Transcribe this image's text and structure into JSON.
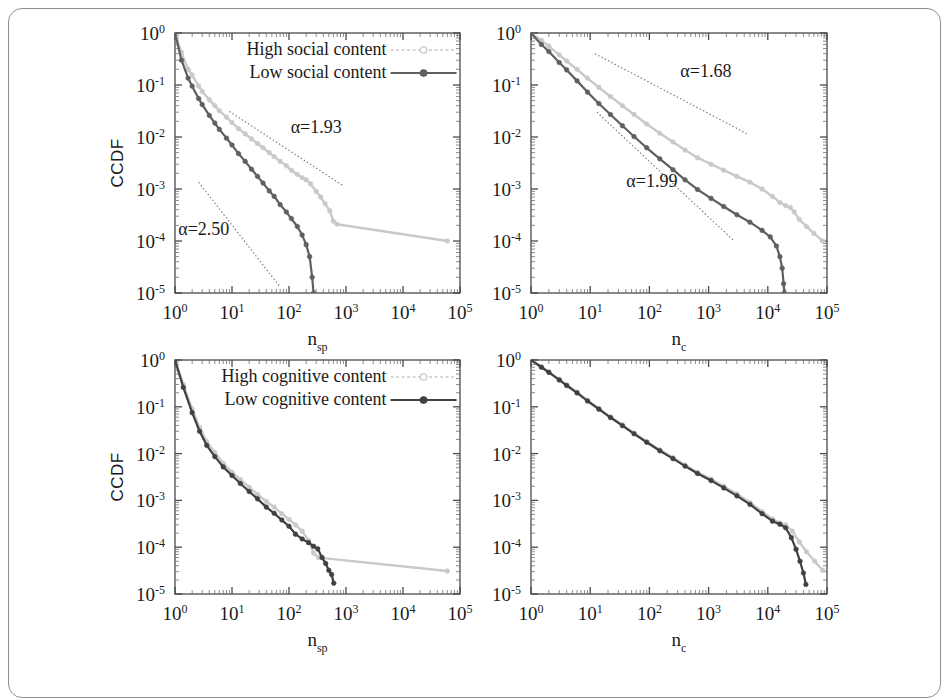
{
  "figure": {
    "frame_border_color": "#8d9096",
    "background": "#ffffff",
    "series_colors": {
      "high": "#c9c9c9",
      "low": "#5f5f5f",
      "low_dark": "#404040",
      "fit_line": "#777777"
    }
  },
  "chart_data": [
    {
      "id": "panel-top-left",
      "type": "line",
      "title": "",
      "xlabel": "n_sp",
      "xlabel_base": "n",
      "xlabel_sub": "sp",
      "ylabel": "CCDF",
      "xscale": "log",
      "yscale": "log",
      "xlim": [
        1,
        100000
      ],
      "ylim": [
        1e-05,
        1
      ],
      "xticks": [
        "10^0",
        "10^1",
        "10^2",
        "10^3",
        "10^4",
        "10^5"
      ],
      "yticks": [
        "10^0",
        "10^-1",
        "10^-2",
        "10^-3",
        "10^-4",
        "10^-5"
      ],
      "grid": false,
      "legend_position": "top-center",
      "legend": [
        {
          "label": "High social content",
          "color": "#c9c9c9",
          "marker": "circle-open"
        },
        {
          "label": "Low social content",
          "color": "#5f5f5f",
          "marker": "circle-filled"
        }
      ],
      "annotations": [
        {
          "text": "α=1.93",
          "x": 300,
          "y": 0.012
        },
        {
          "text": "α=2.50",
          "x": 3.2,
          "y": 0.00013
        }
      ],
      "fit_lines": [
        {
          "alpha": 1.93,
          "x0": 9,
          "y0": 0.031,
          "x1": 900,
          "y1": 0.00115
        },
        {
          "alpha": 2.5,
          "x0": 2.6,
          "y0": 0.00135,
          "x1": 70,
          "y1": 1.3e-05
        }
      ],
      "series": [
        {
          "name": "High social content",
          "color": "#c9c9c9",
          "x": [
            1,
            1.3,
            1.7,
            2,
            2.6,
            3,
            4,
            5,
            6,
            8,
            10,
            13,
            17,
            22,
            28,
            35,
            45,
            55,
            70,
            90,
            110,
            140,
            170,
            200,
            240,
            300,
            360,
            430,
            520,
            600,
            700,
            60000
          ],
          "y": [
            1.0,
            0.42,
            0.2,
            0.155,
            0.095,
            0.075,
            0.052,
            0.04,
            0.032,
            0.024,
            0.019,
            0.0145,
            0.0115,
            0.0092,
            0.0075,
            0.0062,
            0.005,
            0.0042,
            0.0034,
            0.0028,
            0.0023,
            0.0019,
            0.00165,
            0.0015,
            0.00125,
            0.0009,
            0.0007,
            0.00052,
            0.00038,
            0.00024,
            0.00021,
            0.0001
          ]
        },
        {
          "name": "Low social content",
          "color": "#5f5f5f",
          "x": [
            1,
            1.3,
            1.7,
            2,
            2.6,
            3,
            4,
            5,
            6,
            8,
            10,
            13,
            17,
            22,
            28,
            35,
            45,
            55,
            70,
            90,
            110,
            140,
            170,
            200,
            230,
            255,
            270
          ],
          "y": [
            1.0,
            0.3,
            0.135,
            0.095,
            0.055,
            0.042,
            0.026,
            0.0185,
            0.014,
            0.0095,
            0.007,
            0.0048,
            0.0034,
            0.0024,
            0.00175,
            0.0013,
            0.00092,
            0.00072,
            0.0005,
            0.00036,
            0.00027,
            0.00019,
            0.00013,
            8.5e-05,
            5e-05,
            2e-05,
            1e-05
          ]
        }
      ]
    },
    {
      "id": "panel-top-right",
      "type": "line",
      "title": "",
      "xlabel": "n_c",
      "xlabel_base": "n",
      "xlabel_sub": "c",
      "ylabel": "",
      "xscale": "log",
      "yscale": "log",
      "xlim": [
        1,
        100000
      ],
      "ylim": [
        1e-05,
        1
      ],
      "xticks": [
        "10^0",
        "10^1",
        "10^2",
        "10^3",
        "10^4",
        "10^5"
      ],
      "yticks": [
        "10^0",
        "10^-1",
        "10^-2",
        "10^-3",
        "10^-4",
        "10^-5"
      ],
      "grid": false,
      "legend_position": "none",
      "legend": [],
      "annotations": [
        {
          "text": "α=1.68",
          "x": 900,
          "y": 0.14
        },
        {
          "text": "α=1.99",
          "x": 110,
          "y": 0.0011
        }
      ],
      "fit_lines": [
        {
          "alpha": 1.68,
          "x0": 12,
          "y0": 0.4,
          "x1": 4500,
          "y1": 0.0115
        },
        {
          "alpha": 1.99,
          "x0": 13,
          "y0": 0.03,
          "x1": 2700,
          "y1": 0.0001
        }
      ],
      "series": [
        {
          "name": "High cumulative",
          "color": "#c9c9c9",
          "x": [
            1,
            1.5,
            2,
            3,
            4,
            6,
            9,
            14,
            22,
            35,
            55,
            90,
            150,
            250,
            400,
            650,
            1100,
            1800,
            3000,
            5000,
            8000,
            12000,
            16000,
            20000,
            24000,
            28000,
            34000,
            45000,
            60000,
            85000
          ],
          "y": [
            1.0,
            0.72,
            0.56,
            0.38,
            0.29,
            0.2,
            0.135,
            0.09,
            0.06,
            0.04,
            0.027,
            0.0178,
            0.0118,
            0.008,
            0.0056,
            0.004,
            0.003,
            0.0023,
            0.00175,
            0.00135,
            0.001,
            0.00072,
            0.00055,
            0.00048,
            0.00044,
            0.00036,
            0.00026,
            0.00019,
            0.00014,
            0.0001
          ]
        },
        {
          "name": "Low cumulative",
          "color": "#5f5f5f",
          "x": [
            1,
            1.5,
            2,
            3,
            4,
            6,
            9,
            14,
            22,
            35,
            55,
            90,
            150,
            250,
            400,
            650,
            1100,
            1800,
            3000,
            5000,
            8000,
            11000,
            14000,
            16000,
            17500,
            18500,
            19000
          ],
          "y": [
            1.0,
            0.6,
            0.44,
            0.27,
            0.195,
            0.12,
            0.073,
            0.044,
            0.027,
            0.0165,
            0.0102,
            0.0062,
            0.0038,
            0.00235,
            0.0015,
            0.00098,
            0.00066,
            0.00046,
            0.00032,
            0.00023,
            0.00016,
            0.00012,
            8e-05,
            5e-05,
            3e-05,
            1.5e-05,
            1e-05
          ]
        }
      ]
    },
    {
      "id": "panel-bottom-left",
      "type": "line",
      "title": "",
      "xlabel": "n_sp",
      "xlabel_base": "n",
      "xlabel_sub": "sp",
      "ylabel": "CCDF",
      "xscale": "log",
      "yscale": "log",
      "xlim": [
        1,
        100000
      ],
      "ylim": [
        1e-05,
        1
      ],
      "xticks": [
        "10^0",
        "10^1",
        "10^2",
        "10^3",
        "10^4",
        "10^5"
      ],
      "yticks": [
        "10^0",
        "10^-1",
        "10^-2",
        "10^-3",
        "10^-4",
        "10^-5"
      ],
      "grid": false,
      "legend_position": "top-center",
      "legend": [
        {
          "label": "High cognitive content",
          "color": "#c9c9c9",
          "marker": "circle-open"
        },
        {
          "label": "Low cognitive content",
          "color": "#404040",
          "marker": "circle-filled"
        }
      ],
      "annotations": [],
      "fit_lines": [],
      "series": [
        {
          "name": "High cognitive content",
          "color": "#c9c9c9",
          "x": [
            1,
            1.4,
            2,
            2.7,
            3.6,
            5,
            7,
            10,
            14,
            20,
            28,
            40,
            55,
            75,
            100,
            130,
            170,
            220,
            270,
            330,
            60000
          ],
          "y": [
            1.0,
            0.3,
            0.09,
            0.036,
            0.018,
            0.0105,
            0.0062,
            0.004,
            0.0028,
            0.0019,
            0.00135,
            0.00095,
            0.00072,
            0.00052,
            0.00039,
            0.0003,
            0.00022,
            0.00014,
            7.5e-05,
            6e-05,
            3.1e-05
          ]
        },
        {
          "name": "Low cognitive content",
          "color": "#404040",
          "x": [
            1,
            1.4,
            2,
            2.7,
            3.6,
            5,
            7,
            10,
            14,
            20,
            28,
            40,
            55,
            75,
            100,
            130,
            170,
            220,
            270,
            320,
            380,
            440,
            500,
            560,
            610
          ],
          "y": [
            1.0,
            0.26,
            0.075,
            0.03,
            0.015,
            0.0086,
            0.0052,
            0.0034,
            0.0023,
            0.00155,
            0.00108,
            0.00072,
            0.00053,
            0.00038,
            0.00028,
            0.00019,
            0.00015,
            0.000125,
            0.000105,
            9.2e-05,
            6e-05,
            4.5e-05,
            3.2e-05,
            2.6e-05,
            1.7e-05
          ]
        }
      ]
    },
    {
      "id": "panel-bottom-right",
      "type": "line",
      "title": "",
      "xlabel": "n_c",
      "xlabel_base": "n",
      "xlabel_sub": "c",
      "ylabel": "",
      "xscale": "log",
      "yscale": "log",
      "xlim": [
        1,
        100000
      ],
      "ylim": [
        1e-05,
        1
      ],
      "xticks": [
        "10^0",
        "10^1",
        "10^2",
        "10^3",
        "10^4",
        "10^5"
      ],
      "yticks": [
        "10^0",
        "10^-1",
        "10^-2",
        "10^-3",
        "10^-4",
        "10^-5"
      ],
      "grid": false,
      "legend_position": "none",
      "legend": [],
      "annotations": [],
      "fit_lines": [],
      "series": [
        {
          "name": "High cognitive content",
          "color": "#c9c9c9",
          "x": [
            1,
            1.5,
            2,
            3,
            4,
            6,
            9,
            14,
            22,
            35,
            55,
            90,
            150,
            250,
            400,
            650,
            1100,
            1800,
            3000,
            5000,
            8000,
            12000,
            16000,
            20000,
            26000,
            34000,
            45000,
            62000,
            85000
          ],
          "y": [
            1.0,
            0.72,
            0.56,
            0.385,
            0.295,
            0.205,
            0.138,
            0.092,
            0.061,
            0.041,
            0.0275,
            0.0182,
            0.012,
            0.0082,
            0.0057,
            0.004,
            0.00285,
            0.002,
            0.00138,
            0.0009,
            0.00058,
            0.0004,
            0.00033,
            0.0003,
            0.00022,
            0.00013,
            8e-05,
            5e-05,
            3.2e-05
          ]
        },
        {
          "name": "Low cognitive content",
          "color": "#404040",
          "x": [
            1,
            1.5,
            2,
            3,
            4,
            6,
            9,
            14,
            22,
            35,
            55,
            90,
            150,
            250,
            400,
            650,
            1100,
            1800,
            3000,
            5000,
            8000,
            12000,
            16000,
            20000,
            25000,
            30000,
            35000,
            40000,
            44000
          ],
          "y": [
            1.0,
            0.7,
            0.545,
            0.375,
            0.285,
            0.198,
            0.133,
            0.089,
            0.059,
            0.0395,
            0.0265,
            0.0175,
            0.0115,
            0.0078,
            0.0054,
            0.00375,
            0.00265,
            0.00185,
            0.00125,
            0.00082,
            0.00052,
            0.00036,
            0.00031,
            0.00026,
            0.00016,
            9e-05,
            5e-05,
            2.8e-05,
            1.6e-05
          ]
        }
      ]
    }
  ]
}
